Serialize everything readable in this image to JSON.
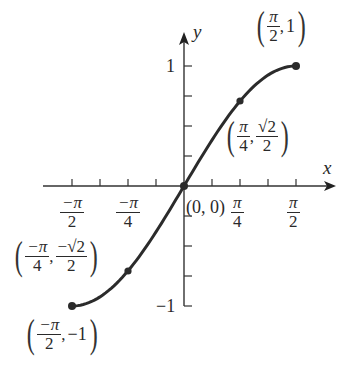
{
  "chart_data": {
    "type": "line",
    "title": "",
    "function": "y = sin(x)",
    "xlabel": "x",
    "ylabel": "y",
    "xlim": [
      -1.5708,
      1.5708
    ],
    "ylim": [
      -1,
      1
    ],
    "grid": false,
    "legend": null,
    "x_ticks": [
      {
        "value": -1.5708,
        "label_num": "−π",
        "label_den": "2"
      },
      {
        "value": -1.1781,
        "label_num": "",
        "label_den": ""
      },
      {
        "value": -0.7854,
        "label_num": "−π",
        "label_den": "4"
      },
      {
        "value": -0.3927,
        "label_num": "",
        "label_den": ""
      },
      {
        "value": 0.3927,
        "label_num": "",
        "label_den": ""
      },
      {
        "value": 0.7854,
        "label_num": "π",
        "label_den": "4"
      },
      {
        "value": 1.1781,
        "label_num": "",
        "label_den": ""
      },
      {
        "value": 1.5708,
        "label_num": "π",
        "label_den": "2"
      }
    ],
    "y_ticks": [
      {
        "value": 1,
        "label": "1"
      },
      {
        "value": 0.75,
        "label": ""
      },
      {
        "value": 0.5,
        "label": ""
      },
      {
        "value": 0.25,
        "label": ""
      },
      {
        "value": -0.25,
        "label": ""
      },
      {
        "value": -0.5,
        "label": ""
      },
      {
        "value": -0.75,
        "label": ""
      },
      {
        "value": -1,
        "label": "−1"
      }
    ],
    "series": [
      {
        "name": "sin x",
        "x": [
          -1.5708,
          -0.7854,
          0,
          0.7854,
          1.5708
        ],
        "y": [
          -1,
          -0.7071,
          0,
          0.7071,
          1
        ]
      }
    ],
    "annotations": [
      {
        "point": [
          1.5708,
          1
        ],
        "text": "(π/2, 1)"
      },
      {
        "point": [
          0.7854,
          0.7071
        ],
        "text": "(π/4, √2/2)"
      },
      {
        "point": [
          0,
          0
        ],
        "text": "(0, 0)"
      },
      {
        "point": [
          -0.7854,
          -0.7071
        ],
        "text": "(−π/4, −√2/2)"
      },
      {
        "point": [
          -1.5708,
          -1
        ],
        "text": "(−π/2, −1)"
      }
    ]
  },
  "axes": {
    "x_label": "x",
    "y_label": "y",
    "y_tick_1": "1",
    "y_tick_neg1": "−1"
  },
  "x_tick_labels": {
    "neg_half_pi": {
      "num": "−π",
      "den": "2"
    },
    "neg_quarter_pi": {
      "num": "−π",
      "den": "4"
    },
    "quarter_pi": {
      "num": "π",
      "den": "4"
    },
    "half_pi": {
      "num": "π",
      "den": "2"
    }
  },
  "point_labels": {
    "top": {
      "x_num": "π",
      "x_den": "2",
      "y": "1",
      "open": "(",
      "close": ")",
      "comma": ","
    },
    "upper": {
      "x_num": "π",
      "x_den": "4",
      "y_num": "√2",
      "y_den": "2",
      "open": "(",
      "close": ")",
      "comma": ","
    },
    "origin": {
      "text": "(0, 0)"
    },
    "lower": {
      "x_num": "−π",
      "x_den": "4",
      "y_num": "−√2",
      "y_den": "2",
      "open": "(",
      "close": ")",
      "comma": ","
    },
    "bottom": {
      "x_num": "−π",
      "x_den": "2",
      "y": "−1",
      "open": "(",
      "close": ")",
      "comma": ","
    }
  },
  "colors": {
    "curve": "#2b2b2b",
    "axes": "#333333",
    "text": "#2a2a2a",
    "background": "#ffffff"
  }
}
